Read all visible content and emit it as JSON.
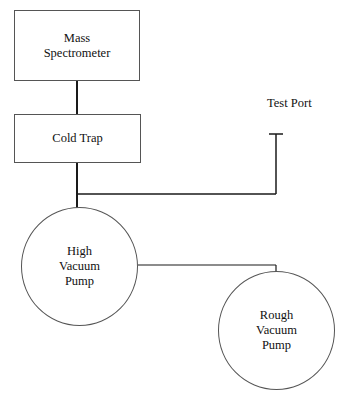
{
  "diagram": {
    "nodes": {
      "mass_spectrometer": {
        "line1": "Mass",
        "line2": "Spectrometer"
      },
      "cold_trap": {
        "label": "Cold Trap"
      },
      "test_port": {
        "label": "Test Port"
      },
      "high_vacuum_pump": {
        "line1": "High",
        "line2": "Vacuum",
        "line3": "Pump"
      },
      "rough_vacuum_pump": {
        "line1": "Rough",
        "line2": "Vacuum",
        "line3": "Pump"
      }
    },
    "connections": [
      {
        "from": "Mass Spectrometer",
        "to": "Cold Trap"
      },
      {
        "from": "Cold Trap",
        "to": "High Vacuum Pump"
      },
      {
        "from": "Cold Trap line",
        "to": "Test Port"
      },
      {
        "from": "High Vacuum Pump",
        "to": "Rough Vacuum Pump"
      }
    ],
    "colors": {
      "line": "#1a1a1a",
      "outline": "#555555",
      "background": "#ffffff"
    }
  }
}
